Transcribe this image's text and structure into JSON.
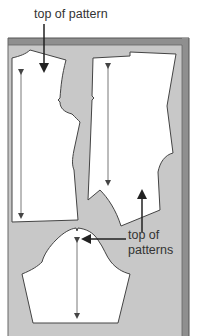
{
  "diagram": {
    "labels": {
      "top_label": "top of pattern",
      "bottom_label_line1": "top of",
      "bottom_label_line2": "patterns"
    },
    "pieces": [
      {
        "name": "left-bodice-piece",
        "grainline": "double-arrow"
      },
      {
        "name": "right-bodice-piece",
        "grainline": "double-arrow"
      },
      {
        "name": "sleeve-piece",
        "grainline": "double-arrow"
      }
    ],
    "colors": {
      "background": "#ffffff",
      "fabric": "#c8c8c8",
      "fabric_fold": "#8a8a8a",
      "fold_dark": "#555555",
      "pattern_fill": "#ffffff",
      "outline": "#444444",
      "arrow": "#333333",
      "text": "#333333"
    }
  }
}
